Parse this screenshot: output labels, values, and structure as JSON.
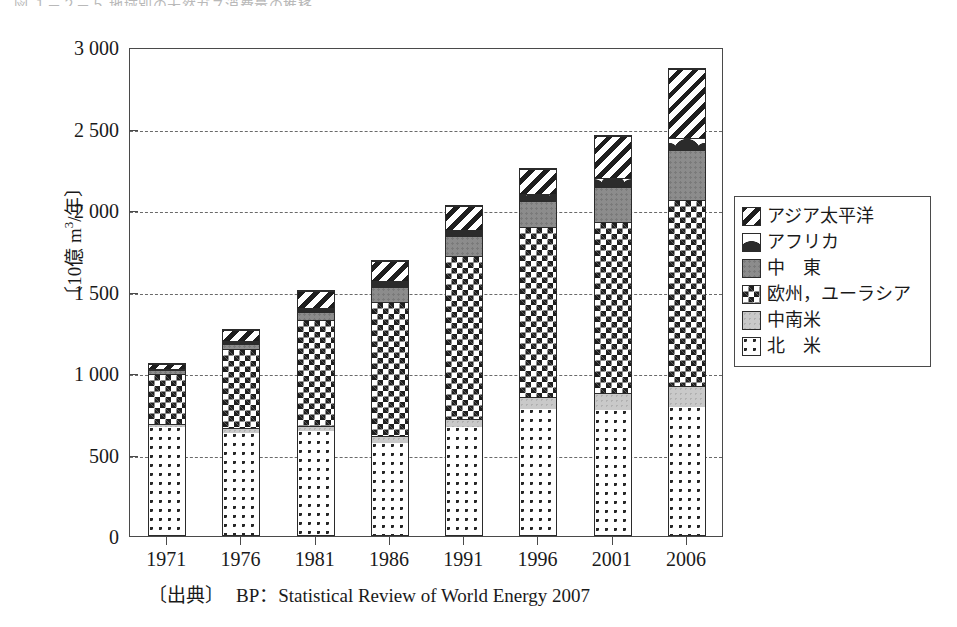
{
  "top_cropped_text": "図  １－２－５  地域別の天然ガス消費量の推移",
  "source": {
    "tag": "〔出典〕",
    "text": "BP：Statistical Review of World Energy 2007"
  },
  "chart_data": {
    "type": "bar",
    "title": "",
    "subtitle": "",
    "stacked": true,
    "xlabel": "",
    "ylabel": "〔10億 m³/年〕",
    "ylabel_parts": {
      "prefix": "〔10億 m",
      "sup": "3",
      "suffix": "/年〕"
    },
    "ylim": [
      0,
      3000
    ],
    "yticks": [
      0,
      500,
      1000,
      1500,
      2000,
      2500,
      3000
    ],
    "ytick_labels": [
      "0",
      "500",
      "1 000",
      "1 500",
      "2 000",
      "2 500",
      "3 000"
    ],
    "grid": true,
    "grid_style": "dashed-horizontal",
    "legend_position": "right",
    "categories": [
      "1971",
      "1976",
      "1981",
      "1986",
      "1991",
      "1996",
      "2001",
      "2006"
    ],
    "series": [
      {
        "name": "北　米",
        "key": "north-america",
        "pattern": "dots",
        "values": [
          670,
          635,
          645,
          570,
          665,
          775,
          770,
          790
        ]
      },
      {
        "name": "中南米",
        "key": "latin-america",
        "pattern": "light-gray",
        "values": [
          20,
          25,
          30,
          40,
          50,
          75,
          105,
          130
        ]
      },
      {
        "name": "欧州，ユーラシア",
        "key": "europe-eurasia",
        "pattern": "checkerboard",
        "values": [
          310,
          490,
          655,
          830,
          1010,
          1050,
          1055,
          1145
        ]
      },
      {
        "name": "中　東",
        "key": "middle-east",
        "pattern": "dark-gray",
        "values": [
          25,
          35,
          50,
          95,
          120,
          160,
          215,
          305
        ]
      },
      {
        "name": "アフリカ",
        "key": "africa",
        "pattern": "circles",
        "values": [
          5,
          15,
          25,
          35,
          40,
          45,
          55,
          75
        ]
      },
      {
        "name": "アジア太平洋",
        "key": "asia-pacific",
        "pattern": "diagonal-stripes",
        "values": [
          30,
          70,
          105,
          125,
          145,
          155,
          260,
          425
        ]
      }
    ],
    "totals": [
      1060,
      1270,
      1470,
      1690,
      2030,
      2260,
      2460,
      2870
    ]
  },
  "legend": {
    "items": [
      {
        "label": "アジア太平洋",
        "key": "asia-pacific"
      },
      {
        "label": "アフリカ",
        "key": "africa"
      },
      {
        "label": "中　東",
        "key": "middle-east"
      },
      {
        "label": "欧州，ユーラシア",
        "key": "europe-eurasia"
      },
      {
        "label": "中南米",
        "key": "latin-america"
      },
      {
        "label": "北　米",
        "key": "north-america"
      }
    ]
  },
  "colors": {
    "frame": "#4a4a4a",
    "grid": "#6a6a6a",
    "bar_outline": "#2b2b2b",
    "text": "#1a1a1a",
    "middle_east_fill": "#8c8c8c",
    "latin_america_fill": "#c9c9c9",
    "background": "#ffffff"
  }
}
